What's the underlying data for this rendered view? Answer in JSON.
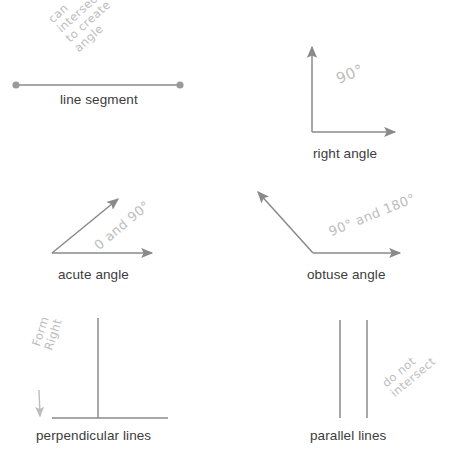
{
  "page": {
    "background_color": "#ffffff",
    "line_color": "#8a8a8a",
    "label_color": "#3c3c3c",
    "handwriting_color": "#bdbdbd"
  },
  "figures": [
    {
      "id": "line-segment",
      "label": "line segment",
      "annotation_lines": [
        "can",
        "intersect",
        "to create",
        "angle"
      ],
      "annotation_text": "can intersect to create angle"
    },
    {
      "id": "right-angle",
      "label": "right angle",
      "annotation_lines": [
        "90°"
      ],
      "annotation_text": "90°"
    },
    {
      "id": "acute-angle",
      "label": "acute angle",
      "annotation_lines": [
        "0 and 90°"
      ],
      "annotation_text": "0 and 90°"
    },
    {
      "id": "obtuse-angle",
      "label": "obtuse angle",
      "annotation_lines": [
        "90° and 180°"
      ],
      "annotation_text": "90° and 180°"
    },
    {
      "id": "perpendicular-lines",
      "label": "perpendicular lines",
      "annotation_lines": [
        "Form",
        "Right"
      ],
      "annotation_text": "Form Right"
    },
    {
      "id": "parallel-lines",
      "label": "parallel lines",
      "annotation_lines": [
        "do not",
        "intersect"
      ],
      "annotation_text": "do not intersect"
    }
  ],
  "labels": {
    "line_segment": "line segment",
    "right_angle": "right angle",
    "acute_angle": "acute angle",
    "obtuse_angle": "obtuse angle",
    "perpendicular_lines": "perpendicular lines",
    "parallel_lines": "parallel lines"
  },
  "annotations": {
    "line_segment": {
      "l1": "can",
      "l2": "intersect",
      "l3": "to create",
      "l4": "angle"
    },
    "right_angle": {
      "l1": "90°"
    },
    "acute_angle": {
      "l1": "0 and 90°"
    },
    "obtuse_angle": {
      "l1": "90° and 180°"
    },
    "perpendicular_lines": {
      "l1": "Form",
      "l2": "Right"
    },
    "parallel_lines": {
      "l1": "do not",
      "l2": "intersect"
    }
  }
}
